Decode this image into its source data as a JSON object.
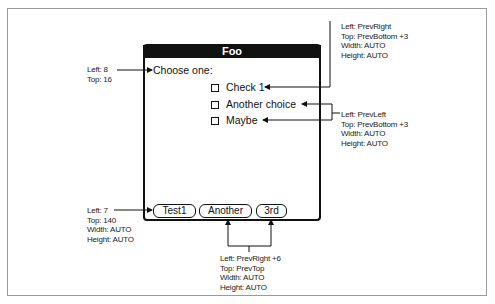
{
  "form": {
    "title": "Foo",
    "label": "Choose one:",
    "checkboxes": [
      {
        "label": "Check 1",
        "checked": false
      },
      {
        "label": "Another choice",
        "checked": false
      },
      {
        "label": "Maybe",
        "checked": false
      }
    ],
    "buttons": [
      {
        "label": "Test1"
      },
      {
        "label": "Another"
      },
      {
        "label": "3rd"
      }
    ]
  },
  "annotations": {
    "label": {
      "left": "Left: 8",
      "top": "Top: 16"
    },
    "first_checkbox": {
      "left": "Left: PrevRight",
      "top": "Top: PrevBottom +3",
      "width": "Width: AUTO",
      "height": "Height: AUTO"
    },
    "other_checkboxes": {
      "left": "Left: PrevLeft",
      "top": "Top: PrevBottom +3",
      "width": "Width: AUTO",
      "height": "Height: AUTO"
    },
    "first_button": {
      "left": "Left: 7",
      "top": "Top: 140",
      "width": "Width: AUTO",
      "height": "Height: AUTO"
    },
    "other_buttons": {
      "left": "Left: PrevRight +6",
      "top": "Top: PrevTop",
      "width": "Width: AUTO",
      "height": "Height: AUTO"
    }
  },
  "colors": {
    "ink": "#111111",
    "frame": "#9a9a9a",
    "background": "#ffffff"
  }
}
